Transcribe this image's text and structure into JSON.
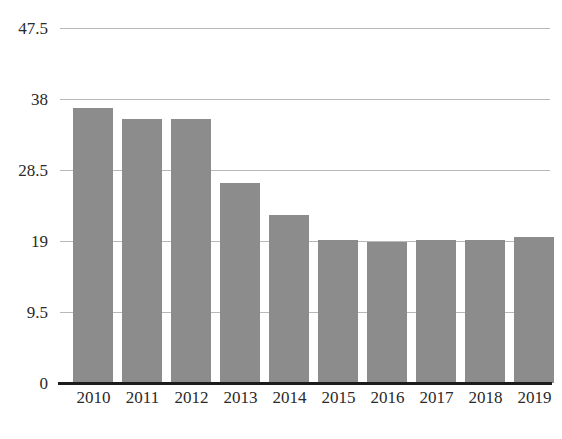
{
  "chart_data": {
    "type": "bar",
    "title": "",
    "subtitle": "",
    "xlabel": "",
    "ylabel": "",
    "categories": [
      "2010",
      "2011",
      "2012",
      "2013",
      "2014",
      "2015",
      "2016",
      "2017",
      "2018",
      "2019"
    ],
    "values": [
      36.8,
      35.3,
      35.3,
      26.8,
      22.5,
      19.1,
      18.9,
      19.1,
      19.2,
      19.5
    ],
    "series": [
      {
        "name": "",
        "values": [
          36.8,
          35.3,
          35.3,
          26.8,
          22.5,
          19.1,
          18.9,
          19.1,
          19.2,
          19.5
        ]
      }
    ],
    "ylim": [
      0,
      47.5
    ],
    "yticks": [
      0,
      9.5,
      19,
      28.5,
      38,
      47.5
    ],
    "ytick_labels": [
      "0",
      "9.5",
      "19",
      "28.5",
      "38",
      "47.5"
    ],
    "xtick_labels": [
      "2010",
      "2011",
      "2012",
      "2013",
      "2014",
      "2015",
      "2016",
      "2017",
      "2018",
      "2019"
    ],
    "grid": true,
    "grid_axis": "y",
    "legend": false,
    "legend_position": "none",
    "annotations": [],
    "colors": {
      "bar": "#8c8c8c",
      "gridline": "#b8b8b8",
      "axis": "#1c1c1c",
      "tick_label": "#2a2a2a",
      "background": "#ffffff"
    }
  },
  "bottom_caption": ""
}
